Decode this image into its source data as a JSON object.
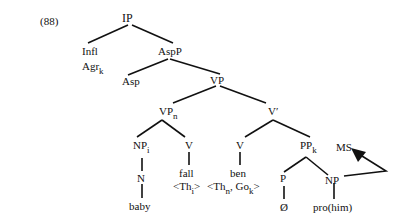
{
  "example_number": "(88)",
  "nodes": {
    "ip": "IP",
    "infl": "Infl",
    "agr": "Agr",
    "agr_sub": "k",
    "aspp": "AspP",
    "asp": "Asp",
    "vp": "VP",
    "vpn": "VP",
    "vpn_sub": "n",
    "vbar": "V′",
    "npi": "NP",
    "npi_sub": "i",
    "v1": "V",
    "v2": "V",
    "ppk": "PP",
    "ppk_sub": "k",
    "ms": "MS",
    "n": "N",
    "fall": "fall",
    "ben": "ben",
    "p": "P",
    "np2": "NP",
    "baby": "baby",
    "null": "Ø",
    "pro": "pro(him)"
  },
  "theta": {
    "fall_open": "<Th",
    "fall_sub": "i",
    "fall_close": ">",
    "ben_open": "<Th",
    "ben_sub1": "n",
    "ben_mid": ", Go",
    "ben_sub2": "k",
    "ben_close": ">"
  },
  "colors": {
    "ink": "#111111",
    "background": "#ffffff"
  }
}
